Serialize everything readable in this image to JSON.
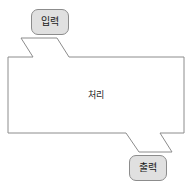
{
  "diagram": {
    "type": "process-flow",
    "canvas": {
      "width": 193,
      "height": 192
    },
    "background_color": "#ffffff",
    "stroke_color": "#8c8c8c",
    "node_fill_color": "#e0e0e0",
    "text_color": "#1a1a1a",
    "nodes": [
      {
        "id": "input",
        "label": "입력",
        "shape": "rounded-rectangle",
        "role": "input-terminal"
      },
      {
        "id": "process",
        "label": "처리",
        "shape": "notched-rectangle",
        "role": "process-body"
      },
      {
        "id": "output",
        "label": "출력",
        "shape": "rounded-rectangle",
        "role": "output-terminal"
      }
    ],
    "connectors": [
      {
        "id": "input-to-process",
        "from": "input",
        "to": "process",
        "style": "notch-taper",
        "position": "top-left"
      },
      {
        "id": "process-to-output",
        "from": "process",
        "to": "output",
        "style": "notch-taper",
        "position": "bottom-right"
      }
    ]
  }
}
